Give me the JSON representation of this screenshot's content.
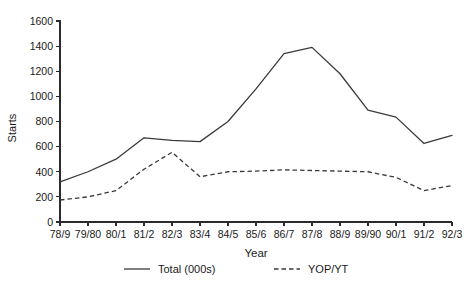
{
  "chart_data": {
    "type": "line",
    "title": "",
    "subtitle": "",
    "xlabel": "Year",
    "ylabel": "Starts",
    "categories": [
      "78/9",
      "79/80",
      "80/1",
      "81/2",
      "82/3",
      "83/4",
      "84/5",
      "85/6",
      "86/7",
      "87/8",
      "88/9",
      "89/90",
      "90/1",
      "91/2",
      "92/3"
    ],
    "series": [
      {
        "name": "Total (000s)",
        "style": "solid",
        "values": [
          320,
          400,
          500,
          670,
          650,
          640,
          800,
          1060,
          1340,
          1390,
          1180,
          890,
          835,
          625,
          690
        ]
      },
      {
        "name": "YOP/YT",
        "style": "dashed",
        "values": [
          175,
          200,
          250,
          420,
          555,
          360,
          400,
          405,
          415,
          410,
          405,
          400,
          355,
          250,
          290
        ]
      }
    ],
    "ylim": [
      0,
      1600
    ],
    "ytick_step": 200,
    "yticks": [
      "0",
      "200",
      "400",
      "600",
      "800",
      "1000",
      "1200",
      "1400",
      "1600"
    ],
    "grid": false,
    "legend_position": "bottom",
    "legend": [
      {
        "label": "Total (000s)",
        "style": "solid"
      },
      {
        "label": "YOP/YT",
        "style": "dashed"
      }
    ],
    "colors": {
      "series": "#3a3a3a",
      "axis": "#2b2b2b",
      "background": "#ffffff"
    }
  }
}
